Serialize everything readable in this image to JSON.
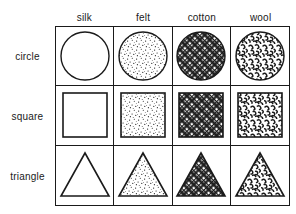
{
  "figure": {
    "name": "shape-material-matrix",
    "background_color": "#ffffff",
    "line_color": "#1a1a1a"
  },
  "columns": [
    {
      "key": "silk",
      "label": "silk",
      "fill": "none"
    },
    {
      "key": "felt",
      "label": "felt",
      "fill": "fine-stipple"
    },
    {
      "key": "cotton",
      "label": "cotton",
      "fill": "diagonal-crosshatch"
    },
    {
      "key": "wool",
      "label": "wool",
      "fill": "dense-squiggle"
    }
  ],
  "rows": [
    {
      "key": "circle",
      "label": "circle",
      "shape": "circle"
    },
    {
      "key": "square",
      "label": "square",
      "shape": "square"
    },
    {
      "key": "triangle",
      "label": "triangle",
      "shape": "triangle"
    }
  ],
  "cells": [
    {
      "row": "circle",
      "column": "silk",
      "shape": "circle",
      "fill": "none",
      "description": "empty circle"
    },
    {
      "row": "circle",
      "column": "felt",
      "shape": "circle",
      "fill": "fine-stipple",
      "description": "stippled circle"
    },
    {
      "row": "circle",
      "column": "cotton",
      "shape": "circle",
      "fill": "diagonal-crosshatch",
      "description": "crosshatched circle"
    },
    {
      "row": "circle",
      "column": "wool",
      "shape": "circle",
      "fill": "dense-squiggle",
      "description": "squiggle filled circle"
    },
    {
      "row": "square",
      "column": "silk",
      "shape": "square",
      "fill": "none",
      "description": "empty square"
    },
    {
      "row": "square",
      "column": "felt",
      "shape": "square",
      "fill": "fine-stipple",
      "description": "stippled square"
    },
    {
      "row": "square",
      "column": "cotton",
      "shape": "square",
      "fill": "diagonal-crosshatch",
      "description": "crosshatched square"
    },
    {
      "row": "square",
      "column": "wool",
      "shape": "square",
      "fill": "dense-squiggle",
      "description": "squiggle filled square"
    },
    {
      "row": "triangle",
      "column": "silk",
      "shape": "triangle",
      "fill": "none",
      "description": "empty triangle"
    },
    {
      "row": "triangle",
      "column": "felt",
      "shape": "triangle",
      "fill": "fine-stipple",
      "description": "stippled triangle"
    },
    {
      "row": "triangle",
      "column": "cotton",
      "shape": "triangle",
      "fill": "diagonal-crosshatch",
      "description": "crosshatched triangle"
    },
    {
      "row": "triangle",
      "column": "wool",
      "shape": "triangle",
      "fill": "dense-squiggle",
      "description": "squiggle filled triangle"
    }
  ]
}
